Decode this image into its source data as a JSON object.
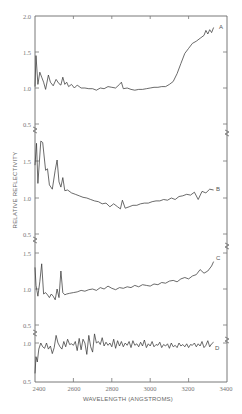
{
  "chart_data": {
    "type": "line",
    "title": "",
    "xlabel": "WAVELENGTH (ANGSTROMS)",
    "ylabel": "RELATIVE REFLECTIVITY",
    "xlim": [
      2400,
      3400
    ],
    "x_ticks": [
      "2400",
      "2600",
      "2800",
      "3000",
      "3200",
      "3400"
    ],
    "grid": false,
    "legend": "inline labels at right end of each curve",
    "layout": "four vertically stacked panels (A, B, C, D) sharing x axis, broken y axis between panels",
    "panels": [
      {
        "name": "A",
        "ylim": [
          0.5,
          2.0
        ],
        "y_ticks": [
          "2.0",
          "1.5",
          "1.0",
          "0.5"
        ],
        "x": [
          2400,
          2405,
          2415,
          2425,
          2435,
          2445,
          2455,
          2470,
          2480,
          2495,
          2510,
          2525,
          2535,
          2545,
          2555,
          2565,
          2575,
          2590,
          2605,
          2620,
          2640,
          2660,
          2680,
          2700,
          2720,
          2740,
          2760,
          2780,
          2800,
          2820,
          2840,
          2850,
          2860,
          2880,
          2900,
          2920,
          2940,
          2960,
          2980,
          3000,
          3020,
          3040,
          3060,
          3080,
          3100,
          3120,
          3140,
          3160,
          3180,
          3200,
          3220,
          3240,
          3260,
          3280,
          3290,
          3300,
          3310,
          3320,
          3330
        ],
        "values": [
          1.02,
          1.45,
          1.05,
          1.22,
          1.15,
          1.08,
          0.98,
          1.18,
          1.08,
          1.03,
          1.12,
          1.06,
          1.04,
          1.15,
          1.05,
          1.08,
          1.02,
          1.05,
          1.0,
          1.04,
          1.0,
          1.0,
          0.99,
          0.99,
          0.97,
          1.0,
          0.99,
          1.02,
          1.01,
          1.0,
          1.05,
          1.08,
          0.99,
          1.0,
          0.98,
          0.97,
          0.98,
          0.98,
          0.99,
          1.0,
          1.01,
          1.01,
          1.02,
          1.02,
          1.05,
          1.09,
          1.2,
          1.34,
          1.48,
          1.55,
          1.62,
          1.65,
          1.69,
          1.73,
          1.8,
          1.75,
          1.81,
          1.77,
          1.84
        ]
      },
      {
        "name": "B",
        "ylim": [
          0.5,
          1.5
        ],
        "y_ticks": [
          "1.5",
          "1.0",
          "0.5"
        ],
        "x": [
          2400,
          2408,
          2415,
          2430,
          2440,
          2455,
          2465,
          2475,
          2490,
          2505,
          2515,
          2525,
          2535,
          2545,
          2555,
          2570,
          2590,
          2610,
          2630,
          2650,
          2670,
          2690,
          2710,
          2730,
          2750,
          2770,
          2790,
          2810,
          2830,
          2845,
          2855,
          2870,
          2890,
          2910,
          2930,
          2950,
          2970,
          2990,
          3010,
          3030,
          3050,
          3070,
          3090,
          3110,
          3130,
          3150,
          3170,
          3190,
          3210,
          3230,
          3250,
          3270,
          3290,
          3310,
          3330
        ],
        "values": [
          1.45,
          1.75,
          1.2,
          1.78,
          1.76,
          1.38,
          1.4,
          1.18,
          1.12,
          1.38,
          1.52,
          1.22,
          1.15,
          1.28,
          1.1,
          1.11,
          1.07,
          1.05,
          1.03,
          1.01,
          1.0,
          0.98,
          0.96,
          0.95,
          0.92,
          0.93,
          0.88,
          0.92,
          0.88,
          0.85,
          0.97,
          0.86,
          0.88,
          0.9,
          0.9,
          0.92,
          0.93,
          0.93,
          0.95,
          0.96,
          0.96,
          0.98,
          0.97,
          1.0,
          0.98,
          1.02,
          1.03,
          1.05,
          1.04,
          1.08,
          0.98,
          1.09,
          1.07,
          1.12,
          1.11
        ]
      },
      {
        "name": "C",
        "ylim": [
          0.5,
          1.5
        ],
        "y_ticks": [
          "1.5",
          "1.0",
          "0.5"
        ],
        "x": [
          2400,
          2405,
          2415,
          2425,
          2435,
          2445,
          2455,
          2465,
          2475,
          2485,
          2495,
          2505,
          2515,
          2525,
          2535,
          2545,
          2555,
          2565,
          2580,
          2600,
          2620,
          2640,
          2660,
          2680,
          2700,
          2720,
          2740,
          2760,
          2780,
          2800,
          2820,
          2840,
          2860,
          2880,
          2900,
          2920,
          2940,
          2960,
          2980,
          3000,
          3020,
          3040,
          3060,
          3080,
          3100,
          3120,
          3140,
          3160,
          3180,
          3200,
          3220,
          3240,
          3260,
          3280,
          3300,
          3320,
          3330
        ],
        "values": [
          1.3,
          1.05,
          0.9,
          1.1,
          1.35,
          0.93,
          0.95,
          0.92,
          0.88,
          0.93,
          0.9,
          0.85,
          1.0,
          0.88,
          1.25,
          0.95,
          0.92,
          0.93,
          0.94,
          0.95,
          0.96,
          0.98,
          0.97,
          0.99,
          1.0,
          0.98,
          1.02,
          1.0,
          1.04,
          1.01,
          0.99,
          1.02,
          1.01,
          1.03,
          1.02,
          1.05,
          1.03,
          1.06,
          1.05,
          1.04,
          1.07,
          1.06,
          1.09,
          1.08,
          1.11,
          1.12,
          1.1,
          1.14,
          1.16,
          1.14,
          1.18,
          1.2,
          1.27,
          1.22,
          1.25,
          1.32,
          1.38
        ]
      },
      {
        "name": "D",
        "ylim": [
          0.5,
          1.0
        ],
        "y_ticks": [
          "1.0",
          "0.5"
        ],
        "x": [
          2400,
          2405,
          2412,
          2420,
          2430,
          2440,
          2450,
          2460,
          2470,
          2480,
          2490,
          2500,
          2510,
          2520,
          2530,
          2540,
          2550,
          2560,
          2570,
          2580,
          2590,
          2600,
          2610,
          2620,
          2630,
          2640,
          2650,
          2660,
          2670,
          2680,
          2690,
          2700,
          2710,
          2720,
          2730,
          2740,
          2750,
          2760,
          2770,
          2780,
          2790,
          2800,
          2810,
          2820,
          2830,
          2840,
          2850,
          2860,
          2870,
          2880,
          2890,
          2900,
          2910,
          2920,
          2930,
          2940,
          2950,
          2960,
          2970,
          2980,
          2990,
          3000,
          3010,
          3020,
          3030,
          3040,
          3050,
          3060,
          3070,
          3080,
          3090,
          3100,
          3110,
          3120,
          3130,
          3140,
          3150,
          3160,
          3170,
          3180,
          3190,
          3200,
          3210,
          3220,
          3230,
          3240,
          3250,
          3260,
          3270,
          3280,
          3290,
          3300,
          3310,
          3320,
          3330
        ],
        "values": [
          0.6,
          0.82,
          0.75,
          0.92,
          1.0,
          0.95,
          0.93,
          1.0,
          0.92,
          0.96,
          0.86,
          0.94,
          1.1,
          1.0,
          0.95,
          0.92,
          1.02,
          0.95,
          1.05,
          0.98,
          0.99,
          0.97,
          1.02,
          0.9,
          1.06,
          0.91,
          1.05,
          1.0,
          0.85,
          1.1,
          0.95,
          0.88,
          1.12,
          1.0,
          1.02,
          0.98,
          1.07,
          0.96,
          1.01,
          0.97,
          1.0,
          0.95,
          1.05,
          0.93,
          1.03,
          0.96,
          1.02,
          0.95,
          1.0,
          0.97,
          1.02,
          0.94,
          1.03,
          0.97,
          0.99,
          0.95,
          1.01,
          0.96,
          1.04,
          0.94,
          0.99,
          0.96,
          1.02,
          0.95,
          0.98,
          0.97,
          1.01,
          0.94,
          0.98,
          0.96,
          0.99,
          0.93,
          1.0,
          0.95,
          0.97,
          0.94,
          1.0,
          0.96,
          0.98,
          0.95,
          0.99,
          0.94,
          0.98,
          0.97,
          1.0,
          0.95,
          0.99,
          0.96,
          1.02,
          0.94,
          0.97,
          1.03,
          0.95,
          0.99,
          1.01
        ]
      }
    ]
  },
  "labels": {
    "xlabel": "WAVELENGTH (ANGSTROMS)",
    "ylabel": "RELATIVE REFLECTIVITY",
    "x_ticks": [
      "2400",
      "2600",
      "2800",
      "3000",
      "3200",
      "3400"
    ],
    "panelA": {
      "name": "A",
      "t0": "2.0",
      "t1": "1.5",
      "t2": "1.0",
      "t3": "0.5"
    },
    "panelB": {
      "name": "B",
      "t0": "1.5",
      "t1": "1.0",
      "t2": "0.5"
    },
    "panelC": {
      "name": "C",
      "t0": "1.5",
      "t1": "1.0",
      "t2": "0.5"
    },
    "panelD": {
      "name": "D",
      "t0": "1.0",
      "t1": "0.5"
    }
  }
}
